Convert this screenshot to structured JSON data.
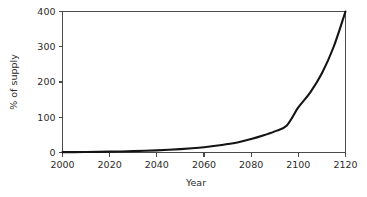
{
  "chart_data": {
    "type": "line",
    "title": "",
    "subtitle": "",
    "xlabel": "Year",
    "ylabel": "% of supply",
    "xlim": [
      2000,
      2120
    ],
    "ylim": [
      0,
      400
    ],
    "grid": false,
    "legend": false,
    "legend_position": "none",
    "x_ticks": [
      2000,
      2020,
      2040,
      2060,
      2080,
      2100,
      2120
    ],
    "x_tick_labels": [
      "2000",
      "2020",
      "2040",
      "2060",
      "2080",
      "2100",
      "2120"
    ],
    "y_ticks": [
      0,
      100,
      200,
      300,
      400
    ],
    "y_tick_labels": [
      "0",
      "100",
      "200",
      "300",
      "400"
    ],
    "series": [
      {
        "name": "% of supply",
        "color": "#141414",
        "x": [
          2000,
          2005,
          2010,
          2015,
          2020,
          2025,
          2030,
          2035,
          2040,
          2045,
          2050,
          2055,
          2060,
          2065,
          2070,
          2075,
          2080,
          2085,
          2090,
          2095,
          2100,
          2105,
          2110,
          2115,
          2120
        ],
        "values": [
          1,
          1.2,
          1.5,
          1.9,
          2.4,
          3.0,
          3.8,
          4.8,
          6.0,
          7.6,
          9.5,
          12,
          15,
          19,
          24,
          30,
          38,
          48,
          60,
          76,
          128,
          170,
          225,
          300,
          400
        ]
      }
    ],
    "annotations": []
  },
  "axes": {
    "y_title": "% of supply",
    "x_title": "Year"
  },
  "colors": {
    "line": "#141414",
    "axis": "#4a4a4a",
    "text": "#2b2b2b",
    "background": "#ffffff"
  }
}
